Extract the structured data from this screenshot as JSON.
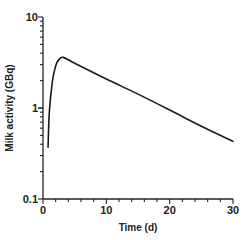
{
  "chart_data": {
    "type": "line",
    "title": "",
    "xlabel": "Time (d)",
    "ylabel": "Milk activity (GBq)",
    "xlim": [
      0,
      30
    ],
    "ylim": [
      0.1,
      10
    ],
    "yscale": "log",
    "grid": false,
    "legend": null,
    "x_ticks": [
      "0",
      "10",
      "20",
      "30"
    ],
    "y_ticks": [
      "0.1",
      "1",
      "10"
    ],
    "series": [
      {
        "name": "Milk activity",
        "color": "#1a1a1a",
        "x": [
          0.8,
          1.0,
          1.5,
          2.0,
          2.5,
          3.2,
          5,
          10,
          15,
          20,
          25,
          30
        ],
        "values": [
          0.37,
          0.9,
          2.0,
          2.9,
          3.4,
          3.6,
          3.1,
          2.08,
          1.42,
          0.95,
          0.63,
          0.43
        ]
      }
    ]
  },
  "labels": {
    "xlabel": "Time (d)",
    "ylabel": "Milk activity (GBq)",
    "x_ticks": [
      "0",
      "10",
      "20",
      "30"
    ],
    "y_ticks": [
      "0.1",
      "1",
      "10"
    ]
  }
}
